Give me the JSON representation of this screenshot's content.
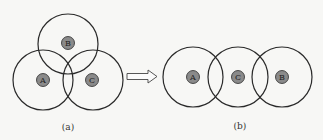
{
  "colors": {
    "background": "#f7f7f5",
    "stroke": "#2a2a2a",
    "node_fill": "#8a8a8a"
  },
  "panel_a": {
    "caption": "(a)",
    "nodes": [
      {
        "label": "B",
        "cx": 68,
        "cy": 44,
        "r": 30
      },
      {
        "label": "A",
        "cx": 43,
        "cy": 80,
        "r": 30
      },
      {
        "label": "C",
        "cx": 93,
        "cy": 80,
        "r": 30
      }
    ]
  },
  "panel_b": {
    "caption": "(b)",
    "nodes": [
      {
        "label": "A",
        "cx": 193,
        "cy": 77,
        "r": 30
      },
      {
        "label": "C",
        "cx": 238,
        "cy": 77,
        "r": 30
      },
      {
        "label": "B",
        "cx": 282,
        "cy": 77,
        "r": 30
      }
    ]
  },
  "arrow": {
    "direction": "right"
  }
}
